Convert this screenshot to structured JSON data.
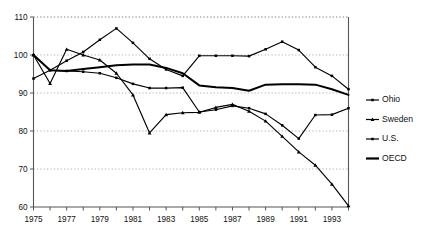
{
  "chart_data": {
    "type": "line",
    "title": "",
    "xlabel": "",
    "ylabel": "",
    "xlim": [
      1975,
      1994
    ],
    "ylim": [
      60,
      110
    ],
    "grid": true,
    "legend_position": "right",
    "x": [
      1975,
      1976,
      1977,
      1978,
      1979,
      1980,
      1981,
      1982,
      1983,
      1984,
      1985,
      1986,
      1987,
      1988,
      1989,
      1990,
      1991,
      1992,
      1993,
      1994
    ],
    "ytick_labels": [
      "110",
      "100",
      "90",
      "80",
      "70",
      "60"
    ],
    "ytick_values": [
      110,
      100,
      90,
      80,
      70,
      60
    ],
    "xtick_labels": [
      "1975",
      "1977",
      "1979",
      "1981",
      "1983",
      "1985",
      "1987",
      "1989",
      "1991",
      "1993"
    ],
    "xtick_values": [
      1975,
      1977,
      1979,
      1981,
      1983,
      1985,
      1987,
      1989,
      1991,
      1993
    ],
    "series": [
      {
        "name": "Ohio",
        "marker": "square",
        "line_width": 1.15,
        "values": [
          100.0,
          96.0,
          95.8,
          95.6,
          95.2,
          94.0,
          92.4,
          91.3,
          91.3,
          91.4,
          85.0,
          85.6,
          86.6,
          86.0,
          84.5,
          81.5,
          78.0,
          84.2,
          84.3,
          86.0
        ]
      },
      {
        "name": "Sweden",
        "marker": "triangle",
        "line_width": 1.15,
        "values": [
          100.0,
          92.5,
          101.5,
          100.0,
          98.7,
          95.2,
          89.5,
          79.5,
          84.3,
          84.8,
          84.9,
          86.2,
          87.0,
          85.2,
          82.6,
          78.6,
          74.5,
          71.0,
          66.0,
          60.3
        ]
      },
      {
        "name": "U.S.",
        "marker": "square",
        "line_width": 1.15,
        "values": [
          93.8,
          96.0,
          98.5,
          100.8,
          104.0,
          107.0,
          103.2,
          99.0,
          96.2,
          94.5,
          99.8,
          99.8,
          99.8,
          99.7,
          101.5,
          103.5,
          101.3,
          96.8,
          94.5,
          91.0
        ]
      },
      {
        "name": "OECD",
        "marker": "none",
        "line_width": 2.0,
        "values": [
          100.0,
          96.0,
          95.8,
          96.3,
          96.8,
          97.3,
          97.5,
          97.5,
          96.6,
          95.2,
          92.0,
          91.5,
          91.3,
          90.6,
          92.2,
          92.3,
          92.3,
          92.2,
          91.0,
          89.5
        ]
      }
    ]
  },
  "legend": {
    "entries": [
      {
        "label": "Ohio"
      },
      {
        "label": "Sweden"
      },
      {
        "label": "U.S."
      },
      {
        "label": "OECD"
      }
    ]
  }
}
